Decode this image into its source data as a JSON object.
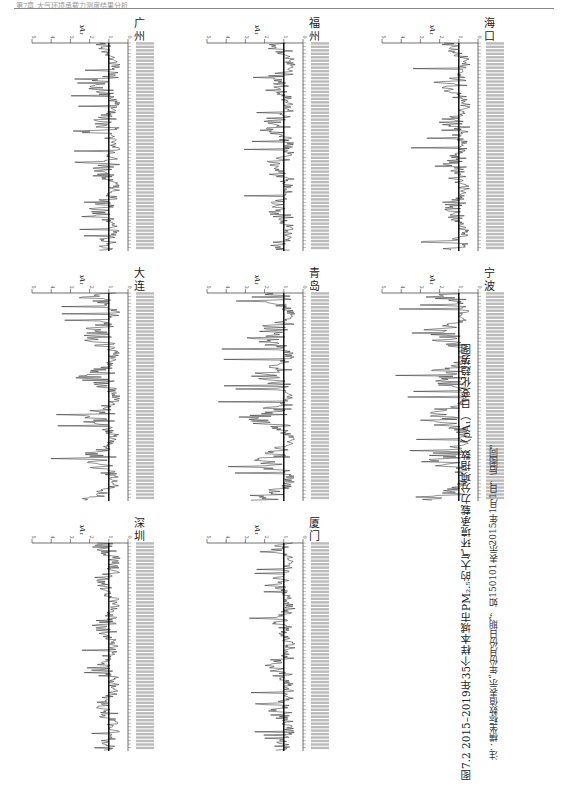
{
  "page": {
    "header_text": "第7章 大气环境承载力测度结果分析",
    "page_number": "—"
  },
  "figure": {
    "caption": "图7.2  2015–2019年35个样本城市PM₂.₅的大气环境承载力分项指数（ρA₁）日变化趋势图",
    "note": "注：横坐标数值表示“年份月份日期”，如150101表示2015年1月1日，后图同。"
  },
  "chart_data": [
    {
      "type": "line",
      "title": "广州",
      "ylabel": "ρA₁",
      "ylim": [
        0,
        5
      ],
      "yticks": [
        0,
        1,
        2,
        3,
        4,
        5
      ],
      "reference_line": 1,
      "xlabel": "日期 (yymmdd)",
      "x_range": [
        "150101",
        "191231"
      ],
      "series": [
        {
          "name": "ρA₁",
          "peak": 3.0,
          "typical_range": [
            0.3,
            2.0
          ]
        }
      ]
    },
    {
      "type": "line",
      "title": "福州",
      "ylabel": "ρA₁",
      "ylim": [
        0,
        5
      ],
      "yticks": [
        0,
        1,
        2,
        3,
        4,
        5
      ],
      "reference_line": 1,
      "xlabel": "日期 (yymmdd)",
      "x_range": [
        "150101",
        "191231"
      ],
      "series": [
        {
          "name": "ρA₁",
          "peak": 3.2,
          "typical_range": [
            0.3,
            2.0
          ]
        }
      ]
    },
    {
      "type": "line",
      "title": "海口",
      "ylabel": "ρA₁",
      "ylim": [
        0,
        5
      ],
      "yticks": [
        0,
        1,
        2,
        3,
        4,
        5
      ],
      "reference_line": 1,
      "xlabel": "日期 (yymmdd)",
      "x_range": [
        "150101",
        "191231"
      ],
      "series": [
        {
          "name": "ρA₁",
          "peak": 3.8,
          "typical_range": [
            0.5,
            2.0
          ]
        }
      ]
    },
    {
      "type": "line",
      "title": "大连",
      "ylabel": "ρA₁",
      "ylim": [
        0,
        5
      ],
      "yticks": [
        0,
        1,
        2,
        3,
        4,
        5
      ],
      "reference_line": 1,
      "xlabel": "日期 (yymmdd)",
      "x_range": [
        "150101",
        "191231"
      ],
      "series": [
        {
          "name": "ρA₁",
          "peak": 4.2,
          "typical_range": [
            0.3,
            2.5
          ]
        }
      ]
    },
    {
      "type": "line",
      "title": "青岛",
      "ylabel": "ρA₁",
      "ylim": [
        0,
        5
      ],
      "yticks": [
        0,
        1,
        2,
        3,
        4,
        5
      ],
      "reference_line": 1,
      "xlabel": "日期 (yymmdd)",
      "x_range": [
        "150101",
        "191231"
      ],
      "series": [
        {
          "name": "ρA₁",
          "peak": 4.5,
          "typical_range": [
            0.3,
            2.8
          ]
        }
      ]
    },
    {
      "type": "line",
      "title": "宁波",
      "ylabel": "ρA₁",
      "ylim": [
        0,
        5
      ],
      "yticks": [
        0,
        1,
        2,
        3,
        4,
        5
      ],
      "reference_line": 1,
      "xlabel": "日期 (yymmdd)",
      "x_range": [
        "150101",
        "191231"
      ],
      "series": [
        {
          "name": "ρA₁",
          "peak": 4.3,
          "typical_range": [
            0.3,
            2.8
          ]
        }
      ]
    },
    {
      "type": "line",
      "title": "深圳",
      "ylabel": "ρA₁",
      "ylim": [
        0,
        5
      ],
      "yticks": [
        0,
        1,
        2,
        3,
        4,
        5
      ],
      "reference_line": 1,
      "xlabel": "日期 (yymmdd)",
      "x_range": [
        "150101",
        "191231"
      ],
      "series": [
        {
          "name": "ρA₁",
          "peak": 2.6,
          "typical_range": [
            0.3,
            1.8
          ]
        }
      ]
    },
    {
      "type": "line",
      "title": "厦门",
      "ylabel": "ρA₁",
      "ylim": [
        0,
        5
      ],
      "yticks": [
        0,
        1,
        2,
        3,
        4,
        5
      ],
      "reference_line": 1,
      "xlabel": "日期 (yymmdd)",
      "x_range": [
        "150101",
        "191231"
      ],
      "series": [
        {
          "name": "ρA₁",
          "peak": 2.8,
          "typical_range": [
            0.3,
            1.8
          ]
        }
      ]
    }
  ],
  "panels": [
    {
      "city": "广州"
    },
    {
      "city": "福州"
    },
    {
      "city": "海口"
    },
    {
      "city": "大连"
    },
    {
      "city": "青岛"
    },
    {
      "city": "宁波"
    },
    {
      "city": "深圳"
    },
    {
      "city": "厦门"
    }
  ]
}
